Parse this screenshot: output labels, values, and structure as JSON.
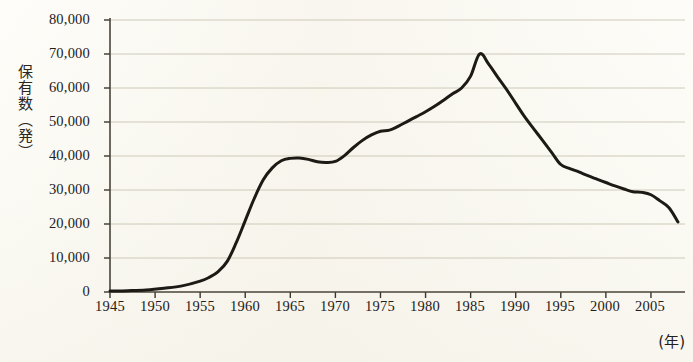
{
  "chart_data": {
    "type": "line",
    "title": "",
    "subtitle": "",
    "xlabel": "(年)",
    "ylabel": "保有数（発）",
    "ylabel_chars": "保有数（発）",
    "xlim": [
      1945,
      2008
    ],
    "ylim": [
      0,
      80000
    ],
    "grid": true,
    "legend": null,
    "y_ticks": [
      0,
      10000,
      20000,
      30000,
      40000,
      50000,
      60000,
      70000,
      80000
    ],
    "y_tick_labels": [
      "0",
      "10,000",
      "20,000",
      "30,000",
      "40,000",
      "50,000",
      "60,000",
      "70,000",
      "80,000"
    ],
    "x_ticks": [
      1945,
      1950,
      1955,
      1960,
      1965,
      1970,
      1975,
      1980,
      1985,
      1990,
      1995,
      2000,
      2005
    ],
    "x_tick_labels": [
      "1945",
      "1950",
      "1955",
      "1960",
      "1965",
      "1970",
      "1975",
      "1980",
      "1985",
      "1990",
      "1995",
      "2000",
      "2005"
    ],
    "series": [
      {
        "name": "保有数",
        "color": "#1d1a16",
        "x": [
          1945,
          1947,
          1949,
          1951,
          1953,
          1955,
          1956,
          1957,
          1958,
          1959,
          1960,
          1961,
          1962,
          1963,
          1964,
          1965,
          1966,
          1967,
          1968,
          1969,
          1970,
          1971,
          1972,
          1973,
          1974,
          1975,
          1976,
          1977,
          1978,
          1979,
          1980,
          1981,
          1982,
          1983,
          1984,
          1985,
          1986,
          1987,
          1988,
          1989,
          1990,
          1991,
          1992,
          1993,
          1994,
          1995,
          1996,
          1997,
          1998,
          1999,
          2000,
          2001,
          2002,
          2003,
          2004,
          2005,
          2006,
          2007,
          2008
        ],
        "y": [
          300,
          400,
          600,
          1100,
          1800,
          3200,
          4300,
          6000,
          9000,
          14500,
          21000,
          27500,
          33000,
          36500,
          38600,
          39300,
          39400,
          39000,
          38300,
          38100,
          38400,
          40100,
          42500,
          44600,
          46200,
          47300,
          47600,
          48800,
          50200,
          51600,
          53000,
          54600,
          56400,
          58300,
          60000,
          63500,
          70000,
          67000,
          63200,
          59500,
          55500,
          51500,
          48000,
          44500,
          41000,
          37500,
          36300,
          35300,
          34200,
          33200,
          32200,
          31200,
          30300,
          29500,
          29300,
          28600,
          26800,
          24800,
          20600
        ]
      }
    ],
    "annotations": []
  },
  "axis": {
    "y_title": "保有数（発）",
    "x_unit": "(年)"
  },
  "colors": {
    "background": "#fdfcf7",
    "line": "#1d1a16",
    "grid": "#c9c4b3",
    "axis": "#3a352d",
    "text": "#23201c"
  }
}
